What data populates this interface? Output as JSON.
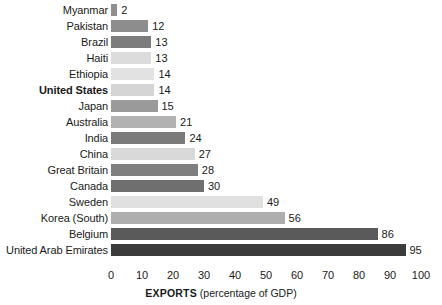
{
  "chart_data": {
    "type": "bar",
    "orientation": "horizontal",
    "title": "",
    "xlabel": "EXPORTS (percentage of GDP)",
    "xlabel_strong": "EXPORTS",
    "xlabel_soft": "(percentage of GDP)",
    "ylabel": "",
    "xlim": [
      0,
      100
    ],
    "grid": false,
    "legend": "none",
    "xticks": [
      0,
      10,
      20,
      30,
      40,
      50,
      60,
      70,
      80,
      90,
      100
    ],
    "xtick_labels": [
      "0",
      "10",
      "20",
      "30",
      "40",
      "50",
      "60",
      "70",
      "80",
      "90",
      "100"
    ],
    "categories": [
      "Myanmar",
      "Pakistan",
      "Brazil",
      "Haiti",
      "Ethiopia",
      "United States",
      "Japan",
      "Australia",
      "India",
      "China",
      "Great Britain",
      "Canada",
      "Sweden",
      "Korea (South)",
      "Belgium",
      "United Arab Emirates"
    ],
    "values": [
      2,
      12,
      13,
      13,
      14,
      14,
      15,
      21,
      24,
      27,
      28,
      30,
      49,
      56,
      86,
      95
    ],
    "value_labels": [
      "2",
      "12",
      "13",
      "13",
      "14",
      "14",
      "15",
      "21",
      "24",
      "27",
      "28",
      "30",
      "49",
      "56",
      "86",
      "95"
    ],
    "highlighted_category": "United States",
    "bar_colors": [
      "#8f8f8f",
      "#8d8d8d",
      "#7c7c7c",
      "#dcdcdc",
      "#e2e2e2",
      "#d5d5d5",
      "#9a9a9a",
      "#b2b2b2",
      "#7a7a7a",
      "#d9d9d9",
      "#7f7f7f",
      "#6f6f6f",
      "#e0e0e0",
      "#aeaeae",
      "#5a5a5a",
      "#3b3b3b"
    ]
  }
}
